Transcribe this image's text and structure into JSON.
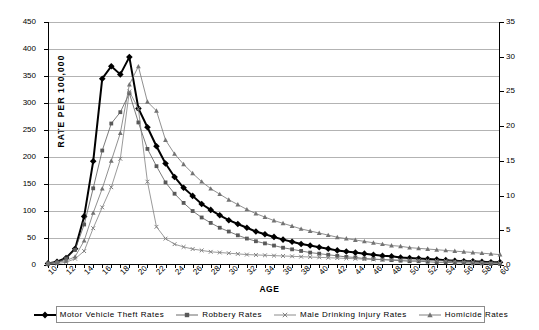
{
  "chart_data": {
    "type": "line",
    "title": "",
    "xlabel": "AGE",
    "ylabel": "RATE PER 100,000",
    "ylabel_right": "",
    "xlim": [
      10,
      60
    ],
    "ylim": [
      0,
      450
    ],
    "ylim_right": [
      0,
      35
    ],
    "yticks": [
      0,
      50,
      100,
      150,
      200,
      250,
      300,
      350,
      400,
      450
    ],
    "yticks_right": [
      0,
      5,
      10,
      15,
      20,
      25,
      30,
      35
    ],
    "xticks": [
      10,
      12,
      14,
      16,
      18,
      20,
      22,
      24,
      26,
      28,
      30,
      32,
      34,
      36,
      38,
      40,
      42,
      44,
      46,
      48,
      50,
      52,
      54,
      56,
      58,
      60
    ],
    "grid": true,
    "legend_position": "bottom",
    "x": [
      10,
      11,
      12,
      13,
      14,
      15,
      16,
      17,
      18,
      19,
      20,
      21,
      22,
      23,
      24,
      25,
      26,
      27,
      28,
      29,
      30,
      31,
      32,
      33,
      34,
      35,
      36,
      37,
      38,
      39,
      40,
      41,
      42,
      43,
      44,
      45,
      46,
      47,
      48,
      49,
      50,
      51,
      52,
      53,
      54,
      55,
      56,
      57,
      58,
      59,
      60
    ],
    "series": [
      {
        "name": "Motor Vehicle Theft Rates",
        "axis": "left",
        "marker": "diamond",
        "color": "#000000",
        "values": [
          3,
          6,
          13,
          30,
          90,
          192,
          345,
          368,
          353,
          385,
          290,
          255,
          220,
          188,
          163,
          143,
          128,
          113,
          102,
          92,
          83,
          76,
          69,
          62,
          57,
          52,
          47,
          43,
          39,
          36,
          33,
          30,
          27,
          25,
          23,
          21,
          19,
          17,
          16,
          14,
          13,
          12,
          11,
          10,
          9,
          8,
          7,
          7,
          6,
          5,
          5
        ]
      },
      {
        "name": "Robbery Rates",
        "axis": "left",
        "marker": "square",
        "color": "#595959",
        "values": [
          2,
          5,
          12,
          28,
          75,
          142,
          212,
          262,
          283,
          318,
          264,
          215,
          183,
          153,
          132,
          115,
          100,
          88,
          78,
          69,
          62,
          55,
          49,
          44,
          40,
          36,
          32,
          29,
          26,
          23,
          21,
          19,
          17,
          15,
          14,
          12,
          11,
          10,
          9,
          8,
          7,
          7,
          6,
          5,
          5,
          4,
          4,
          3,
          3,
          2,
          2
        ]
      },
      {
        "name": "Male Drinking Injury Rates",
        "axis": "right",
        "marker": "cross",
        "color": "#808080",
        "values": [
          0.1,
          0.2,
          0.4,
          0.9,
          2.0,
          5.3,
          8.3,
          11.2,
          15.3,
          25.0,
          22.5,
          12.0,
          5.5,
          3.8,
          3.0,
          2.6,
          2.3,
          2.1,
          1.9,
          1.8,
          1.7,
          1.6,
          1.5,
          1.45,
          1.4,
          1.35,
          1.3,
          1.25,
          1.2,
          1.15,
          1.1,
          1.05,
          1.0,
          0.95,
          0.9,
          0.85,
          0.8,
          0.78,
          0.75,
          0.72,
          0.7,
          0.68,
          0.65,
          0.62,
          0.6,
          0.55,
          0.5,
          0.45,
          0.4,
          0.35,
          0.3
        ]
      },
      {
        "name": "Homicide Rates",
        "axis": "right",
        "marker": "triangle",
        "color": "#737373",
        "values": [
          0.3,
          0.4,
          0.6,
          1.2,
          3.5,
          7.5,
          11.0,
          15.0,
          19.0,
          26.0,
          28.6,
          23.5,
          22.2,
          18.0,
          16.0,
          14.5,
          13.2,
          12.0,
          11.0,
          10.2,
          9.4,
          8.7,
          8.0,
          7.4,
          6.9,
          6.4,
          6.0,
          5.6,
          5.2,
          4.9,
          4.6,
          4.3,
          4.0,
          3.8,
          3.6,
          3.4,
          3.2,
          3.0,
          2.8,
          2.7,
          2.5,
          2.4,
          2.3,
          2.2,
          2.1,
          2.0,
          1.9,
          1.8,
          1.7,
          1.6,
          1.5
        ]
      }
    ],
    "legend": [
      {
        "label": "Motor Vehicle Theft Rates",
        "marker": "diamond",
        "color": "#000000"
      },
      {
        "label": "Robbery Rates",
        "marker": "square",
        "color": "#595959"
      },
      {
        "label": "Male Drinking Injury Rates",
        "marker": "cross",
        "color": "#808080"
      },
      {
        "label": "Homicide Rates",
        "marker": "triangle",
        "color": "#737373"
      }
    ]
  }
}
